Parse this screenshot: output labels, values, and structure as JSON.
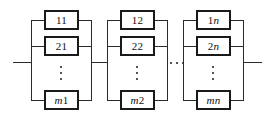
{
  "figure": {
    "type": "reliability-block-diagram",
    "stroke_color": "#1a1a1a",
    "wire_color": "#2b2b2b",
    "background": "#ffffff",
    "width": 272,
    "height": 128
  },
  "groups": [
    {
      "id": "group-1",
      "blocks": [
        {
          "id": "block-11",
          "label": "11"
        },
        {
          "id": "block-21",
          "label": "21"
        },
        {
          "id": "block-m1",
          "label": "m1",
          "italic_prefix": "m",
          "rest": "1"
        }
      ],
      "vertical_ellipsis": "⋮"
    },
    {
      "id": "group-2",
      "blocks": [
        {
          "id": "block-12",
          "label": "12"
        },
        {
          "id": "block-22",
          "label": "22"
        },
        {
          "id": "block-m2",
          "label": "m2",
          "italic_prefix": "m",
          "rest": "2"
        }
      ],
      "vertical_ellipsis": "⋮"
    },
    {
      "id": "group-n",
      "blocks": [
        {
          "id": "block-1n",
          "label": "1n",
          "italic_prefix": "",
          "rest": "1n"
        },
        {
          "id": "block-2n",
          "label": "2n",
          "italic_prefix": "",
          "rest": "2n"
        },
        {
          "id": "block-mn",
          "label": "mn",
          "italic_prefix": "m",
          "rest": "n"
        }
      ],
      "vertical_ellipsis": "⋮"
    }
  ],
  "group_ellipsis": "⋯",
  "labels": {
    "b11": "11",
    "b21": "21",
    "bm1_italic": "m",
    "bm1_rest": "1",
    "b12": "12",
    "b22": "22",
    "bm2_italic": "m",
    "bm2_rest": "2",
    "b1n_rest": "1",
    "b1n_italic": "n",
    "b2n_rest": "2",
    "b2n_italic": "n",
    "bmn_italic": "mn"
  }
}
